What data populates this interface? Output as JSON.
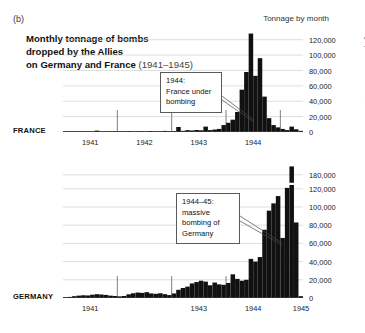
{
  "panel_letter": "(b)",
  "title": {
    "main": "Monthly tonnage of bombs dropped by the Allies on Germany and France ",
    "line1": "Monthly tonnage of bombs",
    "line2": "dropped by the Allies",
    "line3": "on Germany and France ",
    "years": "(1941–1945)"
  },
  "axis_header": "Tonnage by month",
  "copyright": "© Atelier de cartographie / Sciences Po, 2022",
  "labels": {
    "france": "FRANCE",
    "germany": "GERMANY"
  },
  "annotations": {
    "france": {
      "line1": "1944:",
      "line2": "France under",
      "line3": "bombing"
    },
    "germany": {
      "line1": "1944–45:",
      "line2": "massive",
      "line3": "bombing of",
      "line4": "Germany"
    }
  },
  "colors": {
    "bars": "#111111",
    "axis": "#4a4a4a",
    "gridline": "#c8c8c8",
    "text": "#1a1a1a",
    "background": "#ffffff"
  },
  "chart_data": [
    {
      "type": "bar",
      "name": "france",
      "title": "Monthly tonnage of bombs dropped by the Allies on France (1941–1945)",
      "xlabel": "",
      "ylabel": "Tonnage by month",
      "ylim": [
        0,
        130000
      ],
      "yticks": [
        0,
        20000,
        40000,
        60000,
        80000,
        100000,
        120000
      ],
      "ytick_labels": [
        "0",
        "20,000",
        "40,000",
        "60,000",
        "80,000",
        "100,000",
        "120,000"
      ],
      "grid": true,
      "legend": "none",
      "xtick_years": [
        "1941",
        "1942",
        "1943",
        "1944"
      ],
      "x_start": "1941-01",
      "x_end": "1945-05",
      "categories": [
        "1941-01",
        "1941-02",
        "1941-03",
        "1941-04",
        "1941-05",
        "1941-06",
        "1941-07",
        "1941-08",
        "1941-09",
        "1941-10",
        "1941-11",
        "1941-12",
        "1942-01",
        "1942-02",
        "1942-03",
        "1942-04",
        "1942-05",
        "1942-06",
        "1942-07",
        "1942-08",
        "1942-09",
        "1942-10",
        "1942-11",
        "1942-12",
        "1943-01",
        "1943-02",
        "1943-03",
        "1943-04",
        "1943-05",
        "1943-06",
        "1943-07",
        "1943-08",
        "1943-09",
        "1943-10",
        "1943-11",
        "1943-12",
        "1944-01",
        "1944-02",
        "1944-03",
        "1944-04",
        "1944-05",
        "1944-06",
        "1944-07",
        "1944-08",
        "1944-09",
        "1944-10",
        "1944-11",
        "1944-12",
        "1945-01",
        "1945-02",
        "1945-03",
        "1945-04",
        "1945-05"
      ],
      "values": [
        300,
        200,
        400,
        600,
        900,
        700,
        600,
        1800,
        900,
        700,
        600,
        500,
        500,
        700,
        1200,
        900,
        800,
        1100,
        900,
        1300,
        1000,
        900,
        1400,
        1100,
        1200,
        6500,
        1500,
        2400,
        2000,
        2600,
        2200,
        7000,
        2500,
        3200,
        4000,
        9000,
        12000,
        16000,
        26000,
        55000,
        78000,
        128000,
        73000,
        96000,
        46000,
        18000,
        9000,
        6000,
        4000,
        2500,
        7000,
        3500,
        1500
      ]
    },
    {
      "type": "bar",
      "name": "germany",
      "title": "Monthly tonnage of bombs dropped by the Allies on Germany (1941–1945)",
      "xlabel": "",
      "ylabel": "Tonnage by month",
      "ylim": [
        0,
        190000
      ],
      "axis_break": {
        "between": [
          120000,
          180000
        ],
        "note": "broken y-axis above 120,000"
      },
      "yticks": [
        0,
        20000,
        40000,
        60000,
        80000,
        100000,
        120000,
        180000
      ],
      "ytick_labels": [
        "0",
        "20,000",
        "40,000",
        "60,000",
        "80,000",
        "100,000",
        "120,000",
        "180,000"
      ],
      "grid": true,
      "legend": "none",
      "xtick_years": [
        "1941",
        "1943",
        "1944",
        "1945"
      ],
      "x_start": "1941-01",
      "x_end": "1945-05",
      "categories": [
        "1941-01",
        "1941-02",
        "1941-03",
        "1941-04",
        "1941-05",
        "1941-06",
        "1941-07",
        "1941-08",
        "1941-09",
        "1941-10",
        "1941-11",
        "1941-12",
        "1942-01",
        "1942-02",
        "1942-03",
        "1942-04",
        "1942-05",
        "1942-06",
        "1942-07",
        "1942-08",
        "1942-09",
        "1942-10",
        "1942-11",
        "1942-12",
        "1943-01",
        "1943-02",
        "1943-03",
        "1943-04",
        "1943-05",
        "1943-06",
        "1943-07",
        "1943-08",
        "1943-09",
        "1943-10",
        "1943-11",
        "1943-12",
        "1944-01",
        "1944-02",
        "1944-03",
        "1944-04",
        "1944-05",
        "1944-06",
        "1944-07",
        "1944-08",
        "1944-09",
        "1944-10",
        "1944-11",
        "1944-12",
        "1945-01",
        "1945-02",
        "1945-03",
        "1945-04",
        "1945-05"
      ],
      "values": [
        1000,
        1200,
        2000,
        2600,
        3000,
        2800,
        3600,
        4200,
        3800,
        3400,
        2600,
        2200,
        1800,
        2200,
        4000,
        5200,
        6000,
        5600,
        6400,
        5000,
        4600,
        5200,
        4200,
        3200,
        5000,
        9000,
        11000,
        12500,
        16000,
        17500,
        19000,
        18000,
        14000,
        17000,
        15000,
        14500,
        16500,
        26000,
        21000,
        19000,
        20000,
        43000,
        40000,
        45000,
        75000,
        96000,
        104000,
        112000,
        66000,
        124000,
        185000,
        83000,
        2000
      ]
    }
  ]
}
